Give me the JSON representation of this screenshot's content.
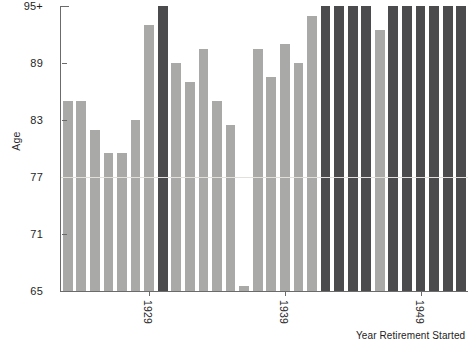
{
  "chart_data": {
    "type": "bar",
    "title": "",
    "xlabel": "Year Retirement Started",
    "ylabel": "Age",
    "ylim": [
      65,
      95
    ],
    "ytick_labels": [
      "65",
      "71",
      "77",
      "83",
      "89",
      "95+"
    ],
    "ytick_values": [
      65,
      71,
      77,
      83,
      89,
      95
    ],
    "xtick_labels": [
      "1929",
      "1939",
      "1949"
    ],
    "xtick_values": [
      1929,
      1939,
      1949
    ],
    "grid": "single horizontal gridline at 77",
    "legend": "none",
    "bar_colors": {
      "light": "#a9a9a7",
      "dark": "#4b4b4d"
    },
    "categories": [
      1923,
      1924,
      1925,
      1926,
      1927,
      1928,
      1929,
      1930,
      1931,
      1932,
      1933,
      1934,
      1935,
      1936,
      1937,
      1938,
      1939,
      1940,
      1941,
      1942,
      1943,
      1944,
      1945,
      1946,
      1947,
      1948,
      1949,
      1950,
      1951,
      1952
    ],
    "values": [
      85,
      85,
      82,
      79.5,
      79.5,
      83,
      93,
      95,
      89,
      87,
      90.5,
      85,
      82.5,
      65.5,
      90.5,
      87.5,
      91,
      89,
      94,
      95,
      95,
      95,
      95,
      92.5,
      95,
      95,
      95,
      95,
      95,
      95
    ],
    "bar_shades": [
      "light",
      "light",
      "light",
      "light",
      "light",
      "light",
      "light",
      "dark",
      "light",
      "light",
      "light",
      "light",
      "light",
      "light",
      "light",
      "light",
      "light",
      "light",
      "light",
      "dark",
      "dark",
      "dark",
      "dark",
      "light",
      "dark",
      "dark",
      "dark",
      "dark",
      "dark",
      "dark"
    ]
  }
}
